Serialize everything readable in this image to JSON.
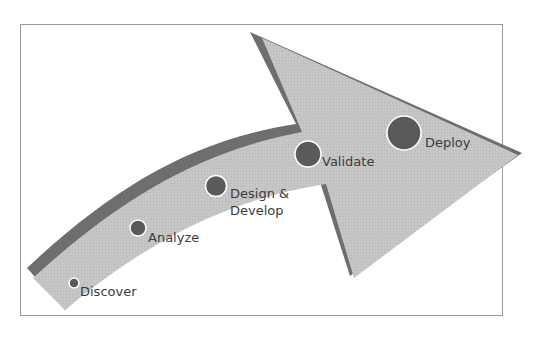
{
  "diagram": {
    "type": "process-arrow",
    "colors": {
      "arrow_fill": "#c4c4c4",
      "arrow_edge": "#6e6e6e",
      "dot_fill": "#5a5a5a",
      "dot_ring": "#ffffff",
      "text": "#3c3c3c",
      "frame": "#9a9a9a"
    },
    "stages": [
      {
        "label": "Discover",
        "size": "smallest"
      },
      {
        "label": "Analyze",
        "size": "small"
      },
      {
        "label": "Design &",
        "label2": "Develop",
        "size": "medium"
      },
      {
        "label": "Validate",
        "size": "large"
      },
      {
        "label": "Deploy",
        "size": "largest"
      }
    ]
  }
}
